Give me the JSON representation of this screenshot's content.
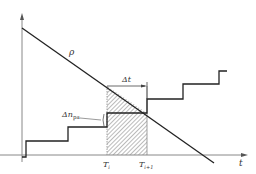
{
  "diagram": {
    "labels": {
      "rho": "ρ",
      "delta_t": "Δt",
      "delta_n": "Δn",
      "delta_n_sub": "pa",
      "t_axis": "t",
      "T_i": "T",
      "T_i_sub": "i",
      "T_i1": "T",
      "T_i1_sub": "i+1"
    },
    "colors": {
      "line": "#222222",
      "axis": "#888888",
      "hatch": "#777777"
    }
  }
}
